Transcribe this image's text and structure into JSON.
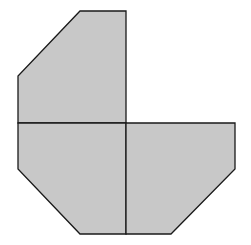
{
  "diagram": {
    "fill": "#c8c8c8",
    "stroke": "#1a1a1a",
    "background": "#ffffff",
    "pieces": [
      {
        "name": "top-left-piece",
        "points": "80,11 126,11 126,123 18,123 18,76"
      },
      {
        "name": "bottom-left-piece",
        "points": "18,123 126,123 126,234 80,234 18,169"
      },
      {
        "name": "bottom-right-piece",
        "points": "126,123 235,123 235,169 171,234 126,234"
      }
    ]
  }
}
